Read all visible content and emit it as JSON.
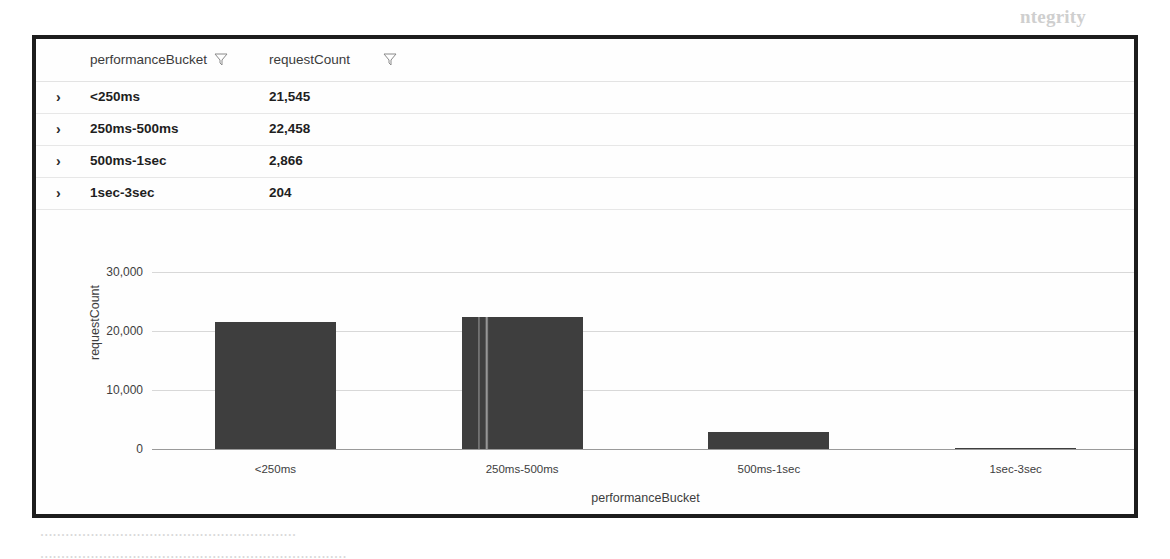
{
  "figure": {
    "table": {
      "columns": [
        {
          "label": "performanceBucket",
          "filter_icon": "filter-funnel-icon"
        },
        {
          "label": "requestCount",
          "filter_icon": "filter-funnel-icon"
        }
      ],
      "expand_glyph": "›",
      "rows": [
        {
          "performanceBucket": "<250ms",
          "requestCount": "21,545"
        },
        {
          "performanceBucket": "250ms-500ms",
          "requestCount": "22,458"
        },
        {
          "performanceBucket": "500ms-1sec",
          "requestCount": "2,866"
        },
        {
          "performanceBucket": "1sec-3sec",
          "requestCount": "204"
        }
      ]
    },
    "chart_data": {
      "type": "bar",
      "title": "",
      "xlabel": "performanceBucket",
      "ylabel": "requestCount",
      "categories": [
        "<250ms",
        "250ms-500ms",
        "500ms-1sec",
        "1sec-3sec"
      ],
      "values": [
        21545,
        22458,
        2866,
        204
      ],
      "ylim": [
        0,
        30000
      ],
      "yticks": [
        "0",
        "10,000",
        "20,000",
        "30,000"
      ],
      "ytick_values": [
        0,
        10000,
        20000,
        30000
      ],
      "grid": true,
      "legend": false,
      "bar_color": "#3e3e3e"
    }
  },
  "background_page": {
    "heading": "ntegrity",
    "lines": [
      "...........",
      "...........................",
      "............................................",
      "........................................................",
      "............................................................",
      "....................................................................",
      "...................................................."
    ],
    "subheading": "...................",
    "footer_lines": [
      ".............................................................",
      "........................................................................."
    ]
  }
}
